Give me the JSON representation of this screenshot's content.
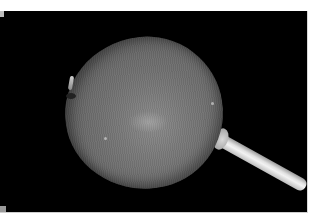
{
  "image": {
    "subject": "grayscale photograph of a round seed pod / fruit on a pale stem",
    "background_color": "#000000",
    "border_color": "#ffffff",
    "fruit_color": "#757575",
    "stem_color": "#e0e0e0"
  }
}
